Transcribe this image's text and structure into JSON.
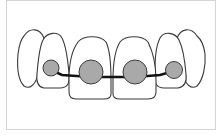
{
  "diagram": {
    "colors": {
      "tooth_fill": "#ffffff",
      "tooth_outline": "#3a3a3a",
      "bracket_fill": "#a9a9a9",
      "bracket_outline": "#3c3c3c",
      "wire": "#111111",
      "frame_border": "#d4d4d4"
    },
    "teeth": [
      {
        "id": "left-canine",
        "path": "M24,36 C30,27 40,28 44,38 C47,50 40,62 38,74 C36,84 30,90 24,86 C18,80 17,66 18,54 C19,46 20,40 24,36 Z"
      },
      {
        "id": "right-canine",
        "path": "M197,36 C191,27 181,28 177,38 C174,50 181,62 183,74 C185,84 191,90 197,86 C203,80 206,66 205,54 C204,46 202,40 197,36 Z"
      },
      {
        "id": "left-lateral-incisor",
        "path": "M43,40 C47,32 58,31 62,38 C67,48 68,62 69,74 C70,84 67,88 60,88 L44,88 C38,87 36,82 37,74 C38,62 39,48 43,40 Z"
      },
      {
        "id": "right-lateral-incisor",
        "path": "M179,40 C175,32 164,31 160,38 C155,48 155,62 155,74 C154,84 157,88 164,88 L178,88 C184,87 187,82 186,74 C185,62 183,48 179,40 Z"
      },
      {
        "id": "left-central-incisor",
        "path": "M78,42 C84,35 100,35 106,42 C110,50 111,64 111,80 L111,94 C111,98 108,99 104,99 L76,99 C71,99 69,97 69,92 L69,80 C69,64 72,50 78,42 Z"
      },
      {
        "id": "right-central-incisor",
        "path": "M120,42 C126,35 142,35 148,42 C152,50 156,64 156,80 L156,92 C156,97 153,99 148,99 L120,99 C116,99 113,98 113,94 L113,80 C113,64 115,50 120,42 Z"
      }
    ],
    "brackets": [
      {
        "id": "bracket-left-lateral",
        "cx": 51,
        "cy": 68,
        "r": 8
      },
      {
        "id": "bracket-left-central",
        "cx": 91,
        "cy": 72,
        "r": 12
      },
      {
        "id": "bracket-right-central",
        "cx": 135,
        "cy": 72,
        "r": 12
      },
      {
        "id": "bracket-right-lateral",
        "cx": 174,
        "cy": 70,
        "r": 8.5
      }
    ],
    "wire_points": "51,70 62,75 91,77 135,77 160,75 174,71"
  }
}
